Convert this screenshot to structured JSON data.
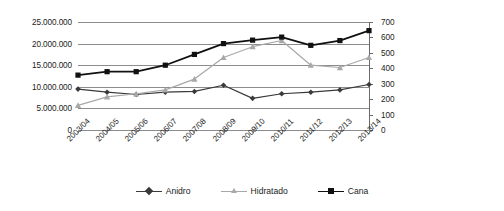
{
  "chart_data": {
    "type": "line",
    "title": "",
    "subtitle": "",
    "xlabel": "",
    "ylabel": "",
    "grid": true,
    "legend_position": "bottom",
    "categories": [
      "2003/04",
      "2004/05",
      "2005/06",
      "2006/07",
      "2007/08",
      "2008/09",
      "2009/10",
      "2010/11",
      "2011/12",
      "2012/13",
      "2013/14"
    ],
    "axes": {
      "left": {
        "label": "",
        "min": 0,
        "max": 25000000,
        "step": 5000000,
        "ticks": [
          "0",
          "5.000.000",
          "10.000.000",
          "15.000.000",
          "20.000.000",
          "25.000.000"
        ],
        "tick_values": [
          0,
          5000000,
          10000000,
          15000000,
          20000000,
          25000000
        ],
        "series": [
          "Cana"
        ]
      },
      "right": {
        "label": "",
        "min": 0,
        "max": 700,
        "step": 100,
        "ticks": [
          "0",
          "100",
          "200",
          "300",
          "400",
          "500",
          "600",
          "700"
        ],
        "tick_values": [
          0,
          100,
          200,
          300,
          400,
          500,
          600,
          700
        ],
        "series": [
          "Anidro",
          "Hidratado"
        ]
      }
    },
    "series": [
      {
        "name": "Anidro",
        "axis": "right",
        "color": "#3a3a3a",
        "marker": "diamond",
        "values": [
          265,
          245,
          230,
          245,
          250,
          290,
          205,
          235,
          245,
          260,
          295
        ]
      },
      {
        "name": "Hidratado",
        "axis": "right",
        "color": "#a8a8a8",
        "marker": "triangle",
        "values": [
          160,
          215,
          235,
          260,
          330,
          470,
          540,
          580,
          420,
          405,
          470
        ]
      },
      {
        "name": "Cana",
        "axis": "left",
        "color": "#111111",
        "marker": "square",
        "values": [
          12700000,
          13500000,
          13500000,
          15000000,
          17500000,
          20000000,
          20800000,
          21500000,
          19600000,
          20700000,
          23000000
        ]
      }
    ],
    "legend": [
      {
        "label": "Anidro",
        "color": "#3a3a3a",
        "marker": "diamond"
      },
      {
        "label": "Hidratado",
        "color": "#a8a8a8",
        "marker": "triangle"
      },
      {
        "label": "Cana",
        "color": "#111111",
        "marker": "square"
      }
    ]
  }
}
